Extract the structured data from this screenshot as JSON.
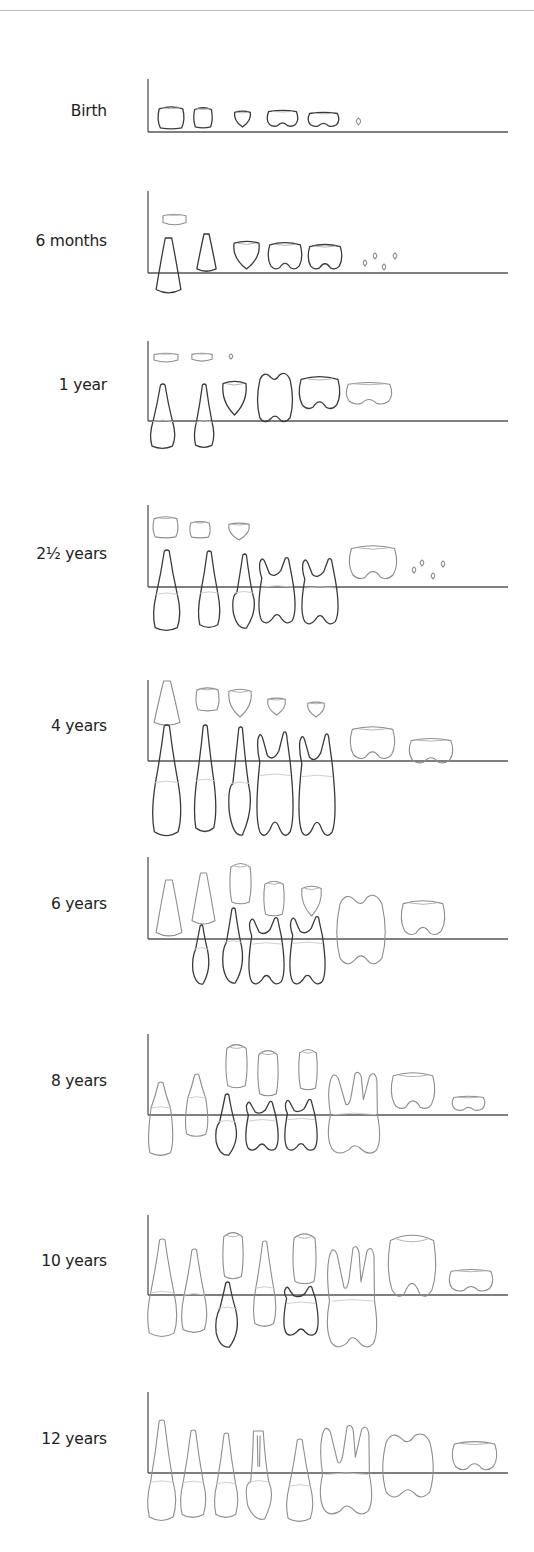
{
  "figure": {
    "legend": {
      "deciduous_color": "#3a3a3a",
      "permanent_color": "#8d8d8d",
      "axis_color": "#555555"
    },
    "tooth_order": [
      "central incisor",
      "lateral incisor",
      "canine",
      "first premolar / first deciduous molar",
      "second premolar / second deciduous molar",
      "first permanent molar",
      "second permanent molar",
      "third permanent molar"
    ],
    "panels": [
      {
        "label": "Birth",
        "teeth": [
          {
            "tooth": "deciduous central incisor",
            "dentition": "deciduous",
            "stage": "crown"
          },
          {
            "tooth": "deciduous lateral incisor",
            "dentition": "deciduous",
            "stage": "crown"
          },
          {
            "tooth": "deciduous canine",
            "dentition": "deciduous",
            "stage": "cusp tip"
          },
          {
            "tooth": "first deciduous molar",
            "dentition": "deciduous",
            "stage": "crown"
          },
          {
            "tooth": "second deciduous molar",
            "dentition": "deciduous",
            "stage": "crown"
          },
          {
            "tooth": "first permanent molar",
            "dentition": "permanent",
            "stage": "cusp tip"
          }
        ]
      },
      {
        "label": "6 months",
        "teeth": [
          {
            "tooth": "permanent central incisor",
            "dentition": "permanent",
            "stage": "crown"
          },
          {
            "tooth": "deciduous central incisor",
            "dentition": "deciduous",
            "stage": "erupting"
          },
          {
            "tooth": "deciduous lateral incisor",
            "dentition": "deciduous",
            "stage": "crown complete"
          },
          {
            "tooth": "deciduous canine",
            "dentition": "deciduous",
            "stage": "crown"
          },
          {
            "tooth": "first deciduous molar",
            "dentition": "deciduous",
            "stage": "crown"
          },
          {
            "tooth": "second deciduous molar",
            "dentition": "deciduous",
            "stage": "crown"
          },
          {
            "tooth": "first permanent molar",
            "dentition": "permanent",
            "stage": "cusp tips"
          }
        ]
      },
      {
        "label": "1 year",
        "teeth": [
          {
            "tooth": "permanent central incisor",
            "dentition": "permanent",
            "stage": "crown"
          },
          {
            "tooth": "permanent lateral incisor",
            "dentition": "permanent",
            "stage": "crown"
          },
          {
            "tooth": "permanent canine",
            "dentition": "permanent",
            "stage": "cusp tip"
          },
          {
            "tooth": "deciduous central incisor",
            "dentition": "deciduous",
            "stage": "erupted"
          },
          {
            "tooth": "deciduous lateral incisor",
            "dentition": "deciduous",
            "stage": "erupted"
          },
          {
            "tooth": "deciduous canine",
            "dentition": "deciduous",
            "stage": "crown"
          },
          {
            "tooth": "first deciduous molar",
            "dentition": "deciduous",
            "stage": "erupting"
          },
          {
            "tooth": "second deciduous molar",
            "dentition": "deciduous",
            "stage": "crown"
          },
          {
            "tooth": "first permanent molar",
            "dentition": "permanent",
            "stage": "crown"
          }
        ]
      },
      {
        "label": "2½ years",
        "teeth": [
          {
            "tooth": "permanent central incisor",
            "dentition": "permanent",
            "stage": "crown"
          },
          {
            "tooth": "permanent lateral incisor",
            "dentition": "permanent",
            "stage": "crown"
          },
          {
            "tooth": "permanent canine",
            "dentition": "permanent",
            "stage": "crown"
          },
          {
            "tooth": "deciduous central incisor",
            "dentition": "deciduous",
            "stage": "erupted"
          },
          {
            "tooth": "deciduous lateral incisor",
            "dentition": "deciduous",
            "stage": "erupted"
          },
          {
            "tooth": "deciduous canine",
            "dentition": "deciduous",
            "stage": "erupted"
          },
          {
            "tooth": "first deciduous molar",
            "dentition": "deciduous",
            "stage": "erupted"
          },
          {
            "tooth": "second deciduous molar",
            "dentition": "deciduous",
            "stage": "erupted"
          },
          {
            "tooth": "first permanent molar",
            "dentition": "permanent",
            "stage": "crown"
          },
          {
            "tooth": "second permanent molar",
            "dentition": "permanent",
            "stage": "cusp tips"
          }
        ]
      },
      {
        "label": "4 years",
        "teeth": [
          {
            "tooth": "permanent central incisor",
            "dentition": "permanent",
            "stage": "crown complete"
          },
          {
            "tooth": "permanent lateral incisor",
            "dentition": "permanent",
            "stage": "crown"
          },
          {
            "tooth": "permanent canine",
            "dentition": "permanent",
            "stage": "crown"
          },
          {
            "tooth": "first premolar",
            "dentition": "permanent",
            "stage": "crown"
          },
          {
            "tooth": "second premolar",
            "dentition": "permanent",
            "stage": "crown"
          },
          {
            "tooth": "deciduous central incisor",
            "dentition": "deciduous",
            "stage": "erupted"
          },
          {
            "tooth": "deciduous lateral incisor",
            "dentition": "deciduous",
            "stage": "erupted"
          },
          {
            "tooth": "deciduous canine",
            "dentition": "deciduous",
            "stage": "erupted"
          },
          {
            "tooth": "first deciduous molar",
            "dentition": "deciduous",
            "stage": "erupted"
          },
          {
            "tooth": "second deciduous molar",
            "dentition": "deciduous",
            "stage": "erupted"
          },
          {
            "tooth": "first permanent molar",
            "dentition": "permanent",
            "stage": "crown complete"
          },
          {
            "tooth": "second permanent molar",
            "dentition": "permanent",
            "stage": "crown"
          }
        ]
      },
      {
        "label": "6 years",
        "teeth": [
          {
            "tooth": "permanent central incisor",
            "dentition": "permanent",
            "stage": "erupting"
          },
          {
            "tooth": "permanent lateral incisor",
            "dentition": "permanent",
            "stage": "root forming"
          },
          {
            "tooth": "permanent canine",
            "dentition": "permanent",
            "stage": "crown complete"
          },
          {
            "tooth": "first premolar",
            "dentition": "permanent",
            "stage": "crown"
          },
          {
            "tooth": "second premolar",
            "dentition": "permanent",
            "stage": "crown"
          },
          {
            "tooth": "deciduous lateral incisor",
            "dentition": "deciduous",
            "stage": "erupted"
          },
          {
            "tooth": "deciduous canine",
            "dentition": "deciduous",
            "stage": "erupted"
          },
          {
            "tooth": "first deciduous molar",
            "dentition": "deciduous",
            "stage": "erupted"
          },
          {
            "tooth": "second deciduous molar",
            "dentition": "deciduous",
            "stage": "erupted"
          },
          {
            "tooth": "first permanent molar",
            "dentition": "permanent",
            "stage": "erupted"
          },
          {
            "tooth": "second permanent molar",
            "dentition": "permanent",
            "stage": "crown"
          }
        ]
      },
      {
        "label": "8 years",
        "teeth": [
          {
            "tooth": "permanent central incisor",
            "dentition": "permanent",
            "stage": "erupted"
          },
          {
            "tooth": "permanent lateral incisor",
            "dentition": "permanent",
            "stage": "erupted"
          },
          {
            "tooth": "permanent canine",
            "dentition": "permanent",
            "stage": "root forming"
          },
          {
            "tooth": "first premolar",
            "dentition": "permanent",
            "stage": "root forming"
          },
          {
            "tooth": "second premolar",
            "dentition": "permanent",
            "stage": "root forming"
          },
          {
            "tooth": "deciduous canine",
            "dentition": "deciduous",
            "stage": "erupted"
          },
          {
            "tooth": "first deciduous molar",
            "dentition": "deciduous",
            "stage": "erupted"
          },
          {
            "tooth": "second deciduous molar",
            "dentition": "deciduous",
            "stage": "erupted"
          },
          {
            "tooth": "first permanent molar",
            "dentition": "permanent",
            "stage": "erupted"
          },
          {
            "tooth": "second permanent molar",
            "dentition": "permanent",
            "stage": "crown complete"
          },
          {
            "tooth": "third permanent molar",
            "dentition": "permanent",
            "stage": "crown"
          }
        ]
      },
      {
        "label": "10 years",
        "teeth": [
          {
            "tooth": "permanent central incisor",
            "dentition": "permanent",
            "stage": "erupted"
          },
          {
            "tooth": "permanent lateral incisor",
            "dentition": "permanent",
            "stage": "erupted"
          },
          {
            "tooth": "permanent canine",
            "dentition": "permanent",
            "stage": "root forming"
          },
          {
            "tooth": "first premolar",
            "dentition": "permanent",
            "stage": "erupted"
          },
          {
            "tooth": "second premolar",
            "dentition": "permanent",
            "stage": "root forming"
          },
          {
            "tooth": "deciduous canine",
            "dentition": "deciduous",
            "stage": "erupted"
          },
          {
            "tooth": "second deciduous molar",
            "dentition": "deciduous",
            "stage": "erupted"
          },
          {
            "tooth": "first permanent molar",
            "dentition": "permanent",
            "stage": "erupted"
          },
          {
            "tooth": "second permanent molar",
            "dentition": "permanent",
            "stage": "root forming"
          },
          {
            "tooth": "third permanent molar",
            "dentition": "permanent",
            "stage": "crown"
          }
        ]
      },
      {
        "label": "12 years",
        "teeth": [
          {
            "tooth": "permanent central incisor",
            "dentition": "permanent",
            "stage": "erupted"
          },
          {
            "tooth": "permanent lateral incisor",
            "dentition": "permanent",
            "stage": "erupted"
          },
          {
            "tooth": "permanent canine",
            "dentition": "permanent",
            "stage": "erupted"
          },
          {
            "tooth": "first premolar",
            "dentition": "permanent",
            "stage": "erupted"
          },
          {
            "tooth": "second premolar",
            "dentition": "permanent",
            "stage": "erupted"
          },
          {
            "tooth": "first permanent molar",
            "dentition": "permanent",
            "stage": "erupted"
          },
          {
            "tooth": "second permanent molar",
            "dentition": "permanent",
            "stage": "erupting"
          },
          {
            "tooth": "third permanent molar",
            "dentition": "permanent",
            "stage": "crown"
          }
        ]
      }
    ]
  }
}
